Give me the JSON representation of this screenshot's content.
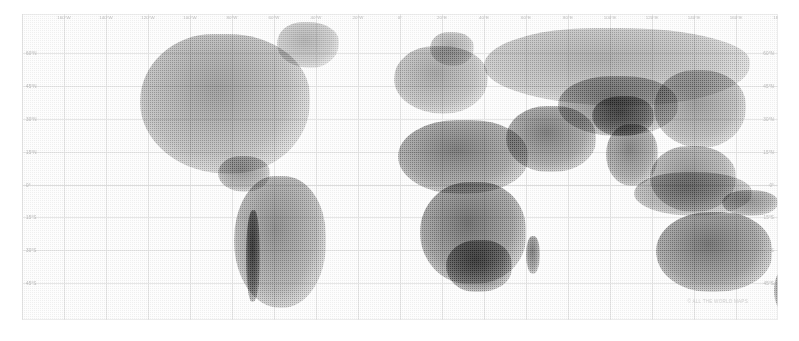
{
  "map": {
    "title": "World Map",
    "projection": "Equirectangular / Plate Carrée",
    "render_style": "halftone-dither grayscale",
    "frame": {
      "x": 22,
      "y": 14,
      "width": 756,
      "height": 306
    },
    "longitude_labels": [
      {
        "label": "160°W",
        "value": -160
      },
      {
        "label": "140°W",
        "value": -140
      },
      {
        "label": "120°W",
        "value": -120
      },
      {
        "label": "100°W",
        "value": -100
      },
      {
        "label": "80°W",
        "value": -80
      },
      {
        "label": "60°W",
        "value": -60
      },
      {
        "label": "40°W",
        "value": -40
      },
      {
        "label": "20°W",
        "value": -20
      },
      {
        "label": "0°",
        "value": 0
      },
      {
        "label": "20°E",
        "value": 20
      },
      {
        "label": "40°E",
        "value": 40
      },
      {
        "label": "60°E",
        "value": 60
      },
      {
        "label": "80°E",
        "value": 80
      },
      {
        "label": "100°E",
        "value": 100
      },
      {
        "label": "120°E",
        "value": 120
      },
      {
        "label": "140°E",
        "value": 140
      },
      {
        "label": "160°E",
        "value": 160
      },
      {
        "label": "180°",
        "value": 180
      }
    ],
    "latitude_labels": [
      {
        "label": "60°N",
        "value": 60
      },
      {
        "label": "45°N",
        "value": 45
      },
      {
        "label": "30°N",
        "value": 30
      },
      {
        "label": "15°N",
        "value": 15
      },
      {
        "label": "0°",
        "value": 0
      },
      {
        "label": "15°S",
        "value": -15
      },
      {
        "label": "30°S",
        "value": -30
      },
      {
        "label": "45°S",
        "value": -45
      }
    ],
    "grid": {
      "visible": true,
      "color": "#e6e6e6",
      "lon_step": 20,
      "lat_step": 15
    },
    "colors": {
      "background": "#ffffff",
      "ocean": "#fdfdfd",
      "frame_border": "#dfdfdf",
      "grid_line": "#e6e6e6",
      "label_text": "#b9b9b9",
      "land_light": "#d8d8d8",
      "land_mid": "#b0b0b0",
      "land_dark": "#6e6e6e",
      "land_darkest": "#3a3a3a",
      "watermark_text": "#cfcfcf"
    },
    "watermark": "© ALL THE WORLD MAPS",
    "landmasses": [
      {
        "name": "north-america",
        "x": 118,
        "y": 20,
        "w": 170,
        "h": 140,
        "tone": 0.3
      },
      {
        "name": "greenland",
        "x": 255,
        "y": 8,
        "w": 62,
        "h": 46,
        "tone": 0.17
      },
      {
        "name": "central-america",
        "x": 196,
        "y": 142,
        "w": 52,
        "h": 36,
        "tone": 0.34
      },
      {
        "name": "south-america",
        "x": 212,
        "y": 162,
        "w": 92,
        "h": 132,
        "tone": 0.4
      },
      {
        "name": "andes-ridge",
        "x": 224,
        "y": 196,
        "w": 14,
        "h": 92,
        "tone": 0.76
      },
      {
        "name": "europe",
        "x": 372,
        "y": 32,
        "w": 94,
        "h": 68,
        "tone": 0.26
      },
      {
        "name": "scandinavia",
        "x": 408,
        "y": 18,
        "w": 44,
        "h": 34,
        "tone": 0.22
      },
      {
        "name": "north-africa",
        "x": 376,
        "y": 106,
        "w": 130,
        "h": 74,
        "tone": 0.52
      },
      {
        "name": "sub-saharan-africa",
        "x": 398,
        "y": 168,
        "w": 106,
        "h": 102,
        "tone": 0.58
      },
      {
        "name": "southern-africa",
        "x": 424,
        "y": 226,
        "w": 66,
        "h": 52,
        "tone": 0.66
      },
      {
        "name": "madagascar",
        "x": 504,
        "y": 222,
        "w": 14,
        "h": 38,
        "tone": 0.52
      },
      {
        "name": "middle-east",
        "x": 484,
        "y": 92,
        "w": 90,
        "h": 66,
        "tone": 0.5
      },
      {
        "name": "russia-siberia",
        "x": 462,
        "y": 14,
        "w": 266,
        "h": 78,
        "tone": 0.22
      },
      {
        "name": "central-asia",
        "x": 536,
        "y": 62,
        "w": 120,
        "h": 60,
        "tone": 0.44
      },
      {
        "name": "himalaya-tibet",
        "x": 570,
        "y": 82,
        "w": 62,
        "h": 40,
        "tone": 0.62
      },
      {
        "name": "india",
        "x": 584,
        "y": 110,
        "w": 52,
        "h": 62,
        "tone": 0.46
      },
      {
        "name": "east-asia",
        "x": 632,
        "y": 56,
        "w": 92,
        "h": 78,
        "tone": 0.32
      },
      {
        "name": "southeast-asia",
        "x": 628,
        "y": 132,
        "w": 86,
        "h": 66,
        "tone": 0.36
      },
      {
        "name": "indonesia",
        "x": 612,
        "y": 158,
        "w": 118,
        "h": 44,
        "tone": 0.33
      },
      {
        "name": "new-guinea",
        "x": 700,
        "y": 176,
        "w": 56,
        "h": 26,
        "tone": 0.4
      },
      {
        "name": "australia",
        "x": 634,
        "y": 198,
        "w": 116,
        "h": 80,
        "tone": 0.56
      },
      {
        "name": "new-zealand",
        "x": 752,
        "y": 256,
        "w": 22,
        "h": 42,
        "tone": 0.4
      }
    ]
  }
}
